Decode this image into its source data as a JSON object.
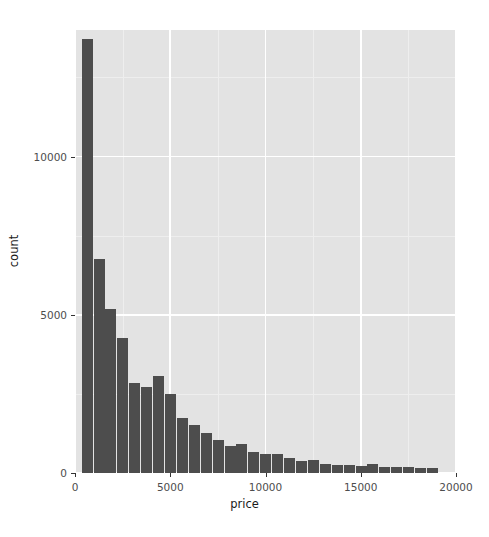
{
  "chart_data": {
    "type": "bar",
    "subtype": "histogram",
    "title": "",
    "xlabel": "price",
    "ylabel": "count",
    "xlim": [
      0,
      20000
    ],
    "ylim": [
      0,
      14000
    ],
    "xticks": [
      0,
      5000,
      10000,
      15000,
      20000
    ],
    "xtick_labels": [
      "0",
      "5000",
      "10000",
      "15000",
      "20000"
    ],
    "yticks": [
      0,
      5000,
      10000
    ],
    "ytick_labels": [
      "0",
      "5000",
      "10000"
    ],
    "grid": true,
    "legend": null,
    "bin_width": 625,
    "bar_color": "#4d4d4d",
    "panel_background": "#e3e3e3",
    "grid_color": "#ffffff",
    "bin_starts": [
      326,
      951,
      1576,
      2201,
      2826,
      3451,
      4076,
      4701,
      5326,
      5951,
      6576,
      7201,
      7826,
      8451,
      9076,
      9701,
      10326,
      10951,
      11576,
      12201,
      12826,
      13451,
      14076,
      14701,
      15326,
      15951,
      16576,
      17201,
      17826,
      18451
    ],
    "bin_centers": [
      638,
      1263,
      1888,
      2513,
      3138,
      3763,
      4388,
      5013,
      5638,
      6263,
      6888,
      7513,
      8138,
      8763,
      9388,
      10013,
      10638,
      11263,
      11888,
      12513,
      13138,
      13763,
      14388,
      15013,
      15638,
      16263,
      16888,
      17513,
      18138,
      18763
    ],
    "values": [
      13716,
      6757,
      5169,
      4257,
      2838,
      2703,
      3074,
      2500,
      1723,
      1520,
      1250,
      1048,
      841,
      905,
      655,
      588,
      588,
      486,
      385,
      418,
      284,
      250,
      250,
      233,
      284,
      200,
      183,
      183,
      166,
      166
    ],
    "categories": [
      "638",
      "1263",
      "1888",
      "2513",
      "3138",
      "3763",
      "4388",
      "5013",
      "5638",
      "6263",
      "6888",
      "7513",
      "8138",
      "8763",
      "9388",
      "10013",
      "10638",
      "11263",
      "11888",
      "12513",
      "13138",
      "13763",
      "14388",
      "15013",
      "15638",
      "16263",
      "16888",
      "17513",
      "18138",
      "18763"
    ]
  },
  "axes": {
    "x_title": "price",
    "y_title": "count"
  }
}
